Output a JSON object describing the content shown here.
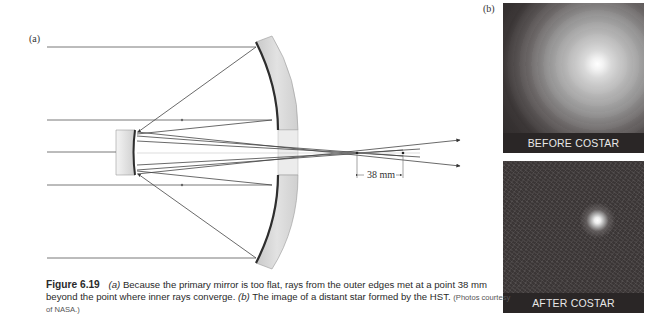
{
  "figure": {
    "number_label": "Figure 6.19",
    "caption_part_a_marker": "(a)",
    "caption_text_a": "Because the primary mirror is too flat, rays from the outer edges met at a point 38 mm beyond the point where inner rays converge.",
    "caption_part_b_marker": "(b)",
    "caption_text_b": "The image of a distant star formed by the HST.",
    "credit": "(Photos courtesy of NASA.)"
  },
  "diagram": {
    "panel_label": "(a)",
    "dimension_label": "38 mm",
    "colors": {
      "ray": "#4a4a4a",
      "mirror_body": "#d6d6d6",
      "mirror_surface": "#2e2e2e"
    }
  },
  "photos": {
    "panel_label": "(b)",
    "before": {
      "caption": "BEFORE COSTAR"
    },
    "after": {
      "caption": "AFTER COSTAR"
    }
  }
}
